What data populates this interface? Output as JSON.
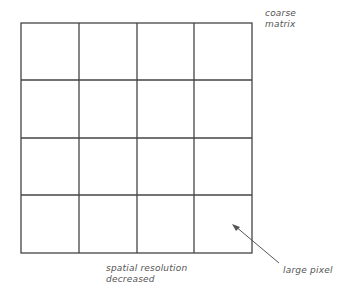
{
  "diagram": {
    "grid": {
      "rows": 4,
      "cols": 4,
      "line_color": "#444444"
    },
    "labels": {
      "coarse_line1": "coarse",
      "coarse_line2": "matrix",
      "spatial_line1": "spatial resolution",
      "spatial_line2": "decreased",
      "large_pixel": "large pixel"
    }
  }
}
